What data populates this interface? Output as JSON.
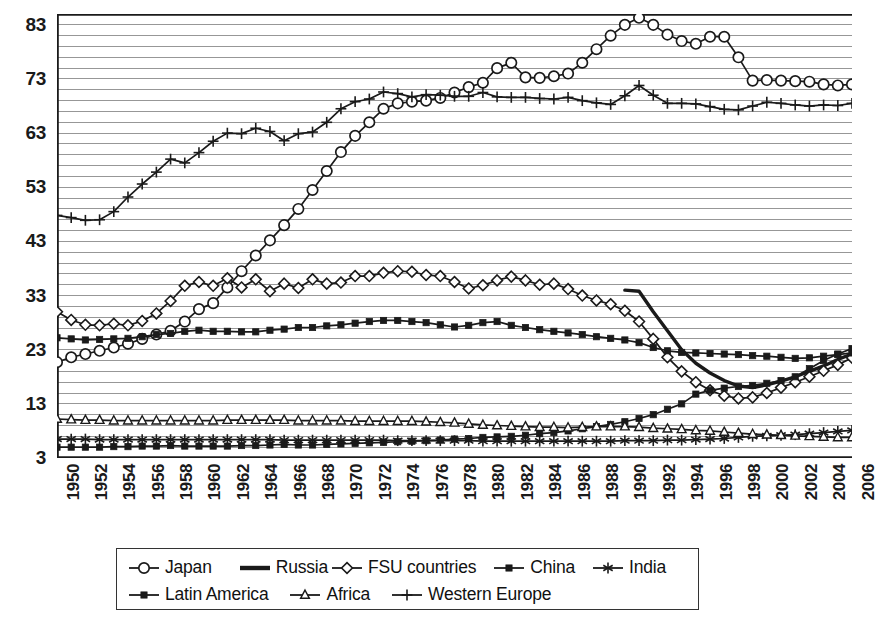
{
  "chart_data": {
    "type": "line",
    "title": "",
    "xlabel": "",
    "ylabel": "",
    "xlim": [
      1950,
      2006
    ],
    "ylim": [
      3,
      85
    ],
    "ytick_values": [
      3,
      13,
      23,
      33,
      43,
      53,
      63,
      73,
      83
    ],
    "ytick_labels": [
      "3",
      "13",
      "23",
      "33",
      "43",
      "53",
      "63",
      "73",
      "83"
    ],
    "gridline_step": 2,
    "grid": true,
    "legend_position": "bottom",
    "xtick_labels": [
      "1950",
      "1952",
      "1954",
      "1956",
      "1958",
      "1960",
      "1962",
      "1964",
      "1966",
      "1968",
      "1970",
      "1972",
      "1974",
      "1976",
      "1978",
      "1980",
      "1982",
      "1984",
      "1986",
      "1988",
      "1990",
      "1992",
      "1994",
      "1996",
      "1998",
      "2000",
      "2002",
      "2004",
      "2006"
    ],
    "x": [
      1950,
      1951,
      1952,
      1953,
      1954,
      1955,
      1956,
      1957,
      1958,
      1959,
      1960,
      1961,
      1962,
      1963,
      1964,
      1965,
      1966,
      1967,
      1968,
      1969,
      1970,
      1971,
      1972,
      1973,
      1974,
      1975,
      1976,
      1977,
      1978,
      1979,
      1980,
      1981,
      1982,
      1983,
      1984,
      1985,
      1986,
      1987,
      1988,
      1989,
      1990,
      1991,
      1992,
      1993,
      1994,
      1995,
      1996,
      1997,
      1998,
      1999,
      2000,
      2001,
      2002,
      2003,
      2004,
      2005,
      2006
    ],
    "series": [
      {
        "name": "Japan",
        "marker": "open-circle",
        "values": [
          20.7,
          21.6,
          22.2,
          22.8,
          23.4,
          24.1,
          25.0,
          25.8,
          26.5,
          28.2,
          30.5,
          31.6,
          34.5,
          37.5,
          40.4,
          43.2,
          46.0,
          49.0,
          52.5,
          56.0,
          59.5,
          62.5,
          65.0,
          67.5,
          68.5,
          68.8,
          69.0,
          69.5,
          70.5,
          71.5,
          72.3,
          75.0,
          76.0,
          73.3,
          73.2,
          73.5,
          74.0,
          76.0,
          78.5,
          81.0,
          83.0,
          84.3,
          83.0,
          81.2,
          80.0,
          79.5,
          80.8,
          80.8,
          77.0,
          72.7,
          72.8,
          72.7,
          72.6,
          72.5,
          72.0,
          71.8,
          72.0
        ]
      },
      {
        "name": "Russia",
        "marker": "none",
        "values": [
          null,
          null,
          null,
          null,
          null,
          null,
          null,
          null,
          null,
          null,
          null,
          null,
          null,
          null,
          null,
          null,
          null,
          null,
          null,
          null,
          null,
          null,
          null,
          null,
          null,
          null,
          null,
          null,
          null,
          null,
          null,
          null,
          null,
          null,
          null,
          null,
          null,
          null,
          null,
          null,
          34.0,
          33.8,
          30.0,
          26.5,
          23.0,
          20.5,
          18.7,
          17.3,
          16.3,
          16.0,
          16.5,
          17.2,
          18.0,
          19.0,
          20.0,
          21.2,
          22.2
        ]
      },
      {
        "name": "FSU countries",
        "marker": "open-diamond",
        "values": [
          30.0,
          28.5,
          27.6,
          27.5,
          27.8,
          27.5,
          28.3,
          29.7,
          32.0,
          34.8,
          35.5,
          34.8,
          36.2,
          34.5,
          36.0,
          33.8,
          35.2,
          34.4,
          36.0,
          35.2,
          35.4,
          36.6,
          36.6,
          37.2,
          37.5,
          37.4,
          36.8,
          36.6,
          35.5,
          34.3,
          34.9,
          35.8,
          36.5,
          35.8,
          35.0,
          35.2,
          34.2,
          33.0,
          32.1,
          31.4,
          30.2,
          28.2,
          25.0,
          21.6,
          19.0,
          17.0,
          15.5,
          14.5,
          14.0,
          14.2,
          15.0,
          16.0,
          17.0,
          18.0,
          19.1,
          20.2,
          21.5
        ]
      },
      {
        "name": "China",
        "marker": "filled-square",
        "values": [
          5.0,
          5.0,
          5.0,
          5.0,
          5.1,
          5.1,
          5.2,
          5.2,
          5.3,
          5.2,
          5.2,
          5.2,
          5.2,
          5.3,
          5.3,
          5.4,
          5.5,
          5.4,
          5.4,
          5.5,
          5.6,
          5.7,
          5.8,
          5.9,
          6.0,
          6.1,
          6.2,
          6.3,
          6.5,
          6.6,
          6.8,
          6.9,
          7.0,
          7.2,
          7.5,
          7.7,
          8.0,
          8.4,
          8.8,
          9.2,
          9.7,
          10.3,
          11.0,
          12.0,
          13.0,
          14.8,
          15.5,
          15.9,
          16.2,
          16.4,
          16.8,
          17.3,
          18.0,
          19.5,
          21.0,
          22.2,
          23.2
        ]
      },
      {
        "name": "India",
        "marker": "asterisk",
        "values": [
          6.5,
          6.5,
          6.5,
          6.4,
          6.4,
          6.4,
          6.4,
          6.4,
          6.4,
          6.4,
          6.4,
          6.4,
          6.4,
          6.4,
          6.4,
          6.4,
          6.3,
          6.3,
          6.3,
          6.3,
          6.3,
          6.3,
          6.3,
          6.3,
          6.2,
          6.2,
          6.2,
          6.2,
          6.2,
          6.2,
          6.1,
          6.1,
          6.1,
          6.1,
          6.1,
          6.1,
          6.1,
          6.1,
          6.1,
          6.1,
          6.2,
          6.2,
          6.2,
          6.3,
          6.3,
          6.4,
          6.5,
          6.6,
          6.8,
          7.0,
          7.1,
          7.2,
          7.3,
          7.5,
          7.7,
          7.9,
          8.1
        ]
      },
      {
        "name": "Latin America",
        "marker": "filled-square",
        "values": [
          25.2,
          25.0,
          24.8,
          24.9,
          25.0,
          25.1,
          25.4,
          25.8,
          26.0,
          26.4,
          26.6,
          26.4,
          26.4,
          26.3,
          26.3,
          26.6,
          26.8,
          27.1,
          27.1,
          27.4,
          27.6,
          27.9,
          28.2,
          28.4,
          28.4,
          28.2,
          28.0,
          27.6,
          27.2,
          27.5,
          28.0,
          28.2,
          27.5,
          27.1,
          26.7,
          26.4,
          26.1,
          25.8,
          25.4,
          25.1,
          24.8,
          24.3,
          23.4,
          22.8,
          22.5,
          22.4,
          22.3,
          22.2,
          22.1,
          21.9,
          21.8,
          21.6,
          21.4,
          21.5,
          21.8,
          22.1,
          22.4
        ]
      },
      {
        "name": "Africa",
        "marker": "open-triangle",
        "values": [
          10.2,
          10.1,
          10.0,
          10.0,
          9.9,
          9.9,
          9.9,
          9.9,
          9.9,
          9.9,
          9.9,
          9.9,
          10.0,
          10.0,
          10.0,
          10.0,
          10.0,
          9.9,
          9.9,
          9.9,
          9.9,
          9.8,
          9.8,
          9.8,
          9.8,
          9.8,
          9.7,
          9.6,
          9.5,
          9.3,
          9.1,
          9.0,
          8.9,
          8.8,
          8.7,
          8.7,
          8.6,
          8.7,
          8.8,
          8.8,
          8.8,
          8.7,
          8.5,
          8.4,
          8.3,
          8.1,
          8.0,
          7.8,
          7.6,
          7.4,
          7.3,
          7.2,
          7.1,
          7.0,
          6.9,
          6.8,
          6.8
        ]
      },
      {
        "name": "Western Europe",
        "marker": "plus",
        "values": [
          47.8,
          47.4,
          46.9,
          47.0,
          48.5,
          51.2,
          53.6,
          55.8,
          58.2,
          57.5,
          59.4,
          61.5,
          63.0,
          62.9,
          63.9,
          63.3,
          61.6,
          62.9,
          63.2,
          65.0,
          67.5,
          68.8,
          69.3,
          70.6,
          70.3,
          69.7,
          70.1,
          70.0,
          69.8,
          69.8,
          70.5,
          69.7,
          69.6,
          69.6,
          69.4,
          69.3,
          69.6,
          69.0,
          68.6,
          68.3,
          69.9,
          71.8,
          70.0,
          68.5,
          68.5,
          68.4,
          67.9,
          67.4,
          67.3,
          68.0,
          68.7,
          68.5,
          68.2,
          68.0,
          68.2,
          68.1,
          68.5
        ]
      }
    ]
  },
  "legend": {
    "row1": [
      {
        "label": "Japan",
        "key": "open-circle-line-key"
      },
      {
        "label": "Russia",
        "key": "plain-thick-line-key"
      },
      {
        "label": "FSU countries",
        "key": "open-diamond-line-key"
      },
      {
        "label": "China",
        "key": "filled-square-line-key"
      },
      {
        "label": "India",
        "key": "asterisk-line-key"
      }
    ],
    "row2": [
      {
        "label": "Latin America",
        "key": "filled-square-line-key"
      },
      {
        "label": "Africa",
        "key": "open-triangle-line-key"
      },
      {
        "label": "Western Europe",
        "key": "plus-line-key"
      }
    ]
  },
  "colors": {
    "axis": "#1a1a1a",
    "grid": "#8c8c8c",
    "series": "#1a1a1a",
    "background": "#ffffff"
  }
}
